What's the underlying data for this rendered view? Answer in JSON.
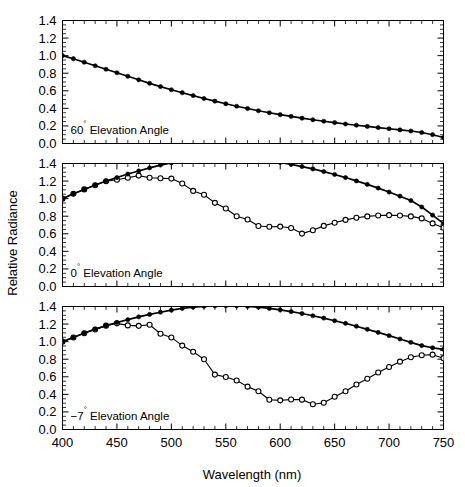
{
  "figure": {
    "xlabel": "Wavelength (nm)",
    "ylabel": "Relative Radiance",
    "x_ticklabels": [
      "400",
      "450",
      "500",
      "550",
      "600",
      "650",
      "700",
      "750"
    ],
    "y_ticklabels": [
      "0.0",
      "0.2",
      "0.4",
      "0.6",
      "0.8",
      "1.0",
      "1.2",
      "1.4"
    ]
  },
  "panels": [
    {
      "label_value": "60",
      "label_degree": "°",
      "label_text": " Elevation Angle",
      "label_full": "60° Elevation Angle"
    },
    {
      "label_value": "0",
      "label_degree": "°",
      "label_text": " Elevation Angle",
      "label_full": "0° Elevation Angle"
    },
    {
      "label_value": "−7",
      "label_degree": "°",
      "label_text": " Elevation Angle",
      "label_full": "−7° Elevation Angle"
    }
  ],
  "chart_data": [
    {
      "type": "line",
      "title": "60° Elevation Angle",
      "xlabel": "Wavelength (nm)",
      "ylabel": "Relative Radiance",
      "xlim": [
        400,
        750
      ],
      "ylim": [
        0.0,
        1.4
      ],
      "grid": false,
      "legend": "none",
      "x": [
        400,
        410,
        420,
        430,
        440,
        450,
        460,
        470,
        480,
        490,
        500,
        510,
        520,
        530,
        540,
        550,
        560,
        570,
        580,
        590,
        600,
        610,
        620,
        630,
        640,
        650,
        660,
        670,
        680,
        690,
        700,
        710,
        720,
        730,
        740,
        750
      ],
      "series": [
        {
          "name": "model",
          "marker": "filled-circle",
          "values": [
            1.0,
            0.965,
            0.925,
            0.885,
            0.845,
            0.805,
            0.765,
            0.725,
            0.685,
            0.648,
            0.612,
            0.578,
            0.545,
            0.512,
            0.482,
            0.452,
            0.424,
            0.398,
            0.373,
            0.35,
            0.328,
            0.308,
            0.288,
            0.27,
            0.253,
            0.238,
            0.222,
            0.208,
            0.194,
            0.181,
            0.168,
            0.155,
            0.142,
            0.125,
            0.1,
            0.068
          ]
        },
        {
          "name": "measured",
          "marker": "open-circle",
          "values": [
            1.0,
            0.962,
            0.922,
            0.882,
            0.842,
            0.802,
            0.762,
            0.722,
            0.682,
            0.645,
            0.609,
            0.575,
            0.542,
            0.509,
            0.479,
            0.449,
            0.421,
            0.395,
            0.37,
            0.347,
            0.325,
            0.305,
            0.285,
            0.267,
            0.25,
            0.235,
            0.219,
            0.205,
            0.191,
            0.178,
            0.165,
            0.152,
            0.139,
            0.122,
            0.097,
            0.065
          ]
        }
      ]
    },
    {
      "type": "line",
      "title": "0° Elevation Angle",
      "xlabel": "Wavelength (nm)",
      "ylabel": "Relative Radiance",
      "xlim": [
        400,
        750
      ],
      "ylim": [
        0.0,
        1.4
      ],
      "grid": false,
      "legend": "none",
      "x": [
        400,
        410,
        420,
        430,
        440,
        450,
        460,
        470,
        480,
        490,
        500,
        510,
        520,
        530,
        540,
        550,
        560,
        570,
        580,
        590,
        600,
        610,
        620,
        630,
        640,
        650,
        660,
        670,
        680,
        690,
        700,
        710,
        720,
        730,
        740,
        750
      ],
      "series": [
        {
          "name": "model",
          "marker": "filled-circle",
          "values": [
            1.0,
            1.055,
            1.105,
            1.155,
            1.2,
            1.24,
            1.28,
            1.315,
            1.35,
            1.382,
            1.408,
            1.43,
            1.448,
            1.462,
            1.47,
            1.472,
            1.468,
            1.46,
            1.448,
            1.432,
            1.412,
            1.39,
            1.365,
            1.338,
            1.308,
            1.275,
            1.24,
            1.202,
            1.162,
            1.12,
            1.075,
            1.028,
            0.978,
            0.905,
            0.812,
            0.715
          ]
        },
        {
          "name": "measured",
          "marker": "open-circle",
          "values": [
            1.0,
            1.055,
            1.105,
            1.152,
            1.198,
            1.215,
            1.238,
            1.262,
            1.238,
            1.232,
            1.228,
            1.172,
            1.088,
            1.045,
            0.952,
            0.888,
            0.8,
            0.762,
            0.688,
            0.68,
            0.682,
            0.665,
            0.602,
            0.64,
            0.69,
            0.725,
            0.758,
            0.782,
            0.798,
            0.808,
            0.812,
            0.808,
            0.798,
            0.775,
            0.718,
            0.668
          ]
        }
      ]
    },
    {
      "type": "line",
      "title": "−7° Elevation Angle",
      "xlabel": "Wavelength (nm)",
      "ylabel": "Relative Radiance",
      "xlim": [
        400,
        750
      ],
      "ylim": [
        0.0,
        1.4
      ],
      "grid": false,
      "legend": "none",
      "x": [
        400,
        410,
        420,
        430,
        440,
        450,
        460,
        470,
        480,
        490,
        500,
        510,
        520,
        530,
        540,
        550,
        560,
        570,
        580,
        590,
        600,
        610,
        620,
        630,
        640,
        650,
        660,
        670,
        680,
        690,
        700,
        710,
        720,
        730,
        740,
        750
      ],
      "series": [
        {
          "name": "model",
          "marker": "filled-circle",
          "values": [
            1.0,
            1.048,
            1.098,
            1.142,
            1.182,
            1.218,
            1.25,
            1.282,
            1.31,
            1.335,
            1.358,
            1.378,
            1.392,
            1.402,
            1.408,
            1.41,
            1.408,
            1.402,
            1.392,
            1.378,
            1.362,
            1.342,
            1.32,
            1.295,
            1.268,
            1.238,
            1.208,
            1.175,
            1.14,
            1.105,
            1.068,
            1.03,
            0.992,
            0.955,
            0.93,
            0.912
          ]
        },
        {
          "name": "measured",
          "marker": "open-circle",
          "values": [
            1.0,
            1.048,
            1.095,
            1.138,
            1.182,
            1.208,
            1.185,
            1.18,
            1.192,
            1.09,
            1.048,
            0.955,
            0.885,
            0.8,
            0.625,
            0.598,
            0.558,
            0.488,
            0.435,
            0.338,
            0.332,
            0.342,
            0.34,
            0.288,
            0.305,
            0.372,
            0.435,
            0.512,
            0.578,
            0.648,
            0.712,
            0.772,
            0.822,
            0.845,
            0.852,
            0.812
          ]
        }
      ]
    }
  ]
}
